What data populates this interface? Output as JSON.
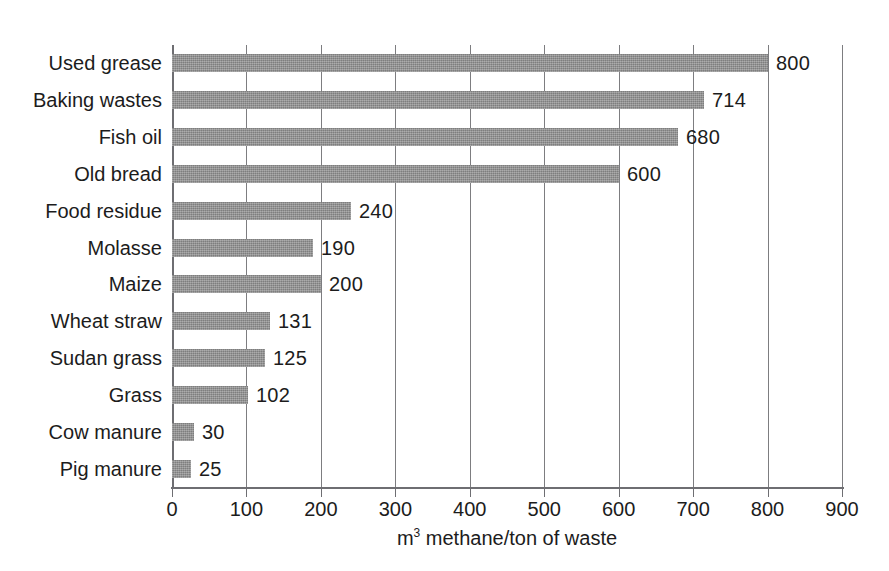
{
  "chart_data": {
    "type": "bar",
    "orientation": "horizontal",
    "title": "",
    "xlabel_prefix": "m",
    "xlabel_sup": "3",
    "xlabel_rest": " methane/ton of waste",
    "xlabel": "m3 methane/ton of waste",
    "ylabel": "",
    "xlim": [
      0,
      900
    ],
    "xticks": [
      0,
      100,
      200,
      300,
      400,
      500,
      600,
      700,
      800,
      900
    ],
    "xtick_labels": [
      "0",
      "100",
      "200",
      "300",
      "400",
      "500",
      "600",
      "700",
      "800",
      "900"
    ],
    "grid": "vertical",
    "legend": "none",
    "value_labels_shown": true,
    "bar_color": "#8d8d8d",
    "gridline_color": "#7d7d80",
    "axis_color": "#6e6e72",
    "text_color": "#1c1c1c",
    "background": "#ffffff",
    "categories": [
      "Used grease",
      "Baking wastes",
      "Fish oil",
      "Old bread",
      "Food residue",
      "Molasse",
      "Maize",
      "Wheat straw",
      "Sudan grass",
      "Grass",
      "Cow manure",
      "Pig manure"
    ],
    "values": [
      800,
      714,
      680,
      600,
      240,
      190,
      200,
      131,
      125,
      102,
      30,
      25
    ],
    "value_label_texts": [
      "800",
      "714",
      "680",
      "600",
      "240",
      "190",
      "200",
      "131",
      "125",
      "102",
      "30",
      "25"
    ],
    "units": "m3 methane per ton of waste"
  }
}
